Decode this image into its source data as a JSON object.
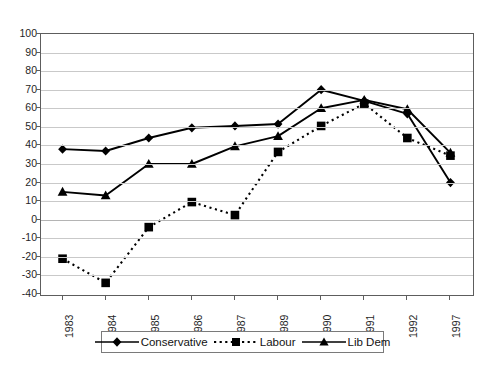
{
  "chart_data": {
    "type": "line",
    "title": "",
    "xlabel": "",
    "ylabel": "",
    "ylim": [
      -40,
      100
    ],
    "ytick_step": 10,
    "grid": true,
    "legend_position": "bottom",
    "categories": [
      "1983",
      "1984",
      "1985",
      "1986",
      "1987",
      "1989",
      "1990",
      "1991",
      "1992",
      "1997"
    ],
    "series": [
      {
        "name": "Conservative",
        "marker": "diamond",
        "linestyle": "solid",
        "color": "#000000",
        "values": [
          38,
          37,
          44,
          49.5,
          50.5,
          51.5,
          70,
          64,
          57,
          20
        ]
      },
      {
        "name": "Labour",
        "marker": "square",
        "linestyle": "dotted",
        "color": "#000000",
        "values": [
          -21,
          -34,
          -4,
          9.5,
          2.5,
          36.5,
          50.5,
          62.5,
          44,
          34.5
        ]
      },
      {
        "name": "Lib Dem",
        "marker": "triangle",
        "linestyle": "solid",
        "color": "#000000",
        "values": [
          15,
          13,
          30,
          30,
          39.5,
          45,
          60,
          64.5,
          59.5,
          36
        ]
      }
    ],
    "yticks": [
      "100",
      "90",
      "80",
      "70",
      "60",
      "50",
      "40",
      "30",
      "20",
      "10",
      "0",
      "-10",
      "-20",
      "-30",
      "-40"
    ]
  },
  "legend": {
    "items": [
      {
        "label": "Conservative"
      },
      {
        "label": "Labour"
      },
      {
        "label": "Lib Dem"
      }
    ]
  }
}
